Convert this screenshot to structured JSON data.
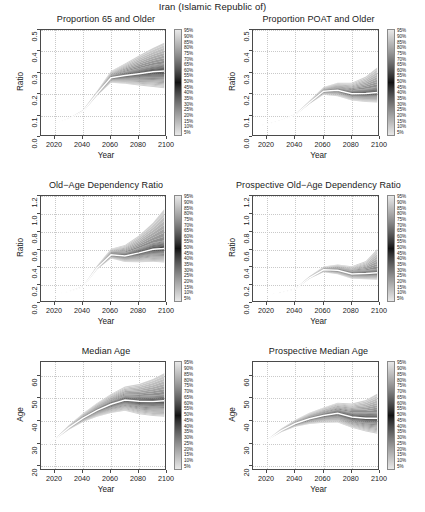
{
  "figure": {
    "main_title": "Iran (Islamic Republic of)",
    "xlabel": "Year",
    "ratio_ylabel": "Ratio",
    "age_ylabel": "Age"
  },
  "legend": {
    "labels": [
      "95%",
      "90%",
      "85%",
      "80%",
      "75%",
      "70%",
      "65%",
      "60%",
      "55%",
      "50%",
      "45%",
      "40%",
      "35%",
      "30%",
      "25%",
      "20%",
      "15%",
      "10%",
      "5%"
    ],
    "light_color": "#e8e8e8",
    "dark_color": "#141414"
  },
  "chart_data": [
    {
      "type": "area",
      "panel": "top-left",
      "title": "Proportion 65 and Older",
      "xlabel": "Year",
      "ylabel": "Ratio",
      "xlim": [
        2010,
        2100
      ],
      "ylim": [
        0.0,
        0.5
      ],
      "xticks": [
        2020,
        2040,
        2060,
        2080,
        2100
      ],
      "yticks": [
        "0.0",
        "0.1",
        "0.2",
        "0.3",
        "0.4",
        "0.5"
      ],
      "grid": true,
      "legend_position": "right",
      "x": [
        2013,
        2020,
        2030,
        2040,
        2050,
        2060,
        2070,
        2080,
        2090,
        2098
      ],
      "series": [
        {
          "name": "median",
          "values": [
            0.051,
            0.062,
            0.086,
            0.121,
            0.202,
            0.277,
            0.287,
            0.296,
            0.305,
            0.308
          ]
        },
        {
          "name": "p05",
          "values": [
            0.051,
            0.062,
            0.085,
            0.118,
            0.193,
            0.254,
            0.249,
            0.241,
            0.234,
            0.228
          ]
        },
        {
          "name": "p25",
          "values": [
            0.051,
            0.062,
            0.086,
            0.12,
            0.198,
            0.268,
            0.271,
            0.274,
            0.276,
            0.275
          ]
        },
        {
          "name": "p75",
          "values": [
            0.051,
            0.062,
            0.087,
            0.123,
            0.207,
            0.288,
            0.305,
            0.321,
            0.336,
            0.344
          ]
        },
        {
          "name": "p95",
          "values": [
            0.051,
            0.063,
            0.088,
            0.126,
            0.215,
            0.308,
            0.344,
            0.381,
            0.416,
            0.441
          ]
        }
      ]
    },
    {
      "type": "area",
      "panel": "top-right",
      "title": "Proportion POAT and Older",
      "xlabel": "Year",
      "ylabel": "Ratio",
      "xlim": [
        2010,
        2100
      ],
      "ylim": [
        0.0,
        0.5
      ],
      "xticks": [
        2020,
        2040,
        2060,
        2080,
        2100
      ],
      "yticks": [
        "0.0",
        "0.1",
        "0.2",
        "0.3",
        "0.4",
        "0.5"
      ],
      "grid": true,
      "legend_position": "right",
      "x": [
        2013,
        2020,
        2030,
        2040,
        2050,
        2060,
        2070,
        2080,
        2090,
        2098
      ],
      "series": [
        {
          "name": "median",
          "values": [
            0.051,
            0.06,
            0.077,
            0.104,
            0.16,
            0.214,
            0.218,
            0.202,
            0.203,
            0.208
          ]
        },
        {
          "name": "p05",
          "values": [
            0.051,
            0.06,
            0.077,
            0.102,
            0.154,
            0.198,
            0.191,
            0.17,
            0.164,
            0.161
          ]
        },
        {
          "name": "p25",
          "values": [
            0.051,
            0.06,
            0.077,
            0.103,
            0.157,
            0.208,
            0.208,
            0.189,
            0.186,
            0.188
          ]
        },
        {
          "name": "p75",
          "values": [
            0.051,
            0.061,
            0.078,
            0.105,
            0.163,
            0.221,
            0.23,
            0.219,
            0.226,
            0.235
          ]
        },
        {
          "name": "p95",
          "values": [
            0.051,
            0.061,
            0.079,
            0.108,
            0.169,
            0.234,
            0.254,
            0.253,
            0.283,
            0.325
          ]
        }
      ]
    },
    {
      "type": "area",
      "panel": "middle-left",
      "title": "Old−Age Dependency Ratio",
      "xlabel": "Year",
      "ylabel": "Ratio",
      "xlim": [
        2010,
        2100
      ],
      "ylim": [
        0.0,
        1.2
      ],
      "xticks": [
        2020,
        2040,
        2060,
        2080,
        2100
      ],
      "yticks": [
        "0.0",
        "0.2",
        "0.4",
        "0.6",
        "0.8",
        "1.0",
        "1.2"
      ],
      "grid": true,
      "legend_position": "right",
      "x": [
        2013,
        2020,
        2030,
        2040,
        2050,
        2060,
        2070,
        2080,
        2090,
        2098
      ],
      "series": [
        {
          "name": "median",
          "values": [
            0.085,
            0.098,
            0.128,
            0.18,
            0.392,
            0.54,
            0.528,
            0.562,
            0.602,
            0.612
          ]
        },
        {
          "name": "p05",
          "values": [
            0.085,
            0.098,
            0.127,
            0.177,
            0.376,
            0.498,
            0.461,
            0.458,
            0.462,
            0.455
          ]
        },
        {
          "name": "p25",
          "values": [
            0.085,
            0.098,
            0.128,
            0.179,
            0.386,
            0.523,
            0.501,
            0.521,
            0.545,
            0.549
          ]
        },
        {
          "name": "p75",
          "values": [
            0.085,
            0.099,
            0.129,
            0.183,
            0.4,
            0.562,
            0.566,
            0.618,
            0.677,
            0.7
          ]
        },
        {
          "name": "p95",
          "values": [
            0.085,
            0.099,
            0.131,
            0.188,
            0.419,
            0.609,
            0.65,
            0.757,
            0.901,
            1.051
          ]
        }
      ]
    },
    {
      "type": "area",
      "panel": "middle-right",
      "title": "Prospective Old−Age Dependency Ratio",
      "xlabel": "Year",
      "ylabel": "Ratio",
      "xlim": [
        2010,
        2100
      ],
      "ylim": [
        0.0,
        1.2
      ],
      "xticks": [
        2020,
        2040,
        2060,
        2080,
        2100
      ],
      "yticks": [
        "0.0",
        "0.2",
        "0.4",
        "0.6",
        "0.8",
        "1.0",
        "1.2"
      ],
      "grid": true,
      "legend_position": "right",
      "x": [
        2013,
        2020,
        2030,
        2040,
        2050,
        2060,
        2070,
        2080,
        2090,
        2098
      ],
      "series": [
        {
          "name": "median",
          "values": [
            0.078,
            0.09,
            0.116,
            0.158,
            0.283,
            0.372,
            0.368,
            0.326,
            0.33,
            0.34
          ]
        },
        {
          "name": "p05",
          "values": [
            0.078,
            0.09,
            0.115,
            0.155,
            0.272,
            0.345,
            0.322,
            0.273,
            0.265,
            0.262
          ]
        },
        {
          "name": "p25",
          "values": [
            0.078,
            0.09,
            0.116,
            0.157,
            0.278,
            0.361,
            0.35,
            0.305,
            0.303,
            0.308
          ]
        },
        {
          "name": "p75",
          "values": [
            0.078,
            0.091,
            0.117,
            0.16,
            0.289,
            0.385,
            0.39,
            0.355,
            0.367,
            0.383
          ]
        },
        {
          "name": "p95",
          "values": [
            0.078,
            0.091,
            0.118,
            0.164,
            0.3,
            0.408,
            0.432,
            0.412,
            0.47,
            0.605
          ]
        }
      ]
    },
    {
      "type": "area",
      "panel": "bottom-left",
      "title": "Median Age",
      "xlabel": "Year",
      "ylabel": "Age",
      "xlim": [
        2010,
        2100
      ],
      "ylim": [
        18,
        66
      ],
      "xticks": [
        2020,
        2040,
        2060,
        2080,
        2100
      ],
      "yticks": [
        "20",
        "30",
        "40",
        "50",
        "60"
      ],
      "grid": true,
      "legend_position": "right",
      "x": [
        2013,
        2020,
        2030,
        2040,
        2050,
        2060,
        2070,
        2080,
        2090,
        2098
      ],
      "series": [
        {
          "name": "median",
          "values": [
            28.2,
            32.0,
            37.1,
            41.3,
            44.7,
            47.4,
            49.3,
            48.7,
            48.6,
            48.9
          ]
        },
        {
          "name": "p05",
          "values": [
            28.2,
            31.9,
            36.2,
            39.6,
            41.9,
            43.5,
            44.5,
            43.0,
            42.2,
            41.9
          ]
        },
        {
          "name": "p25",
          "values": [
            28.2,
            32.0,
            36.8,
            40.6,
            43.6,
            45.9,
            47.4,
            46.4,
            46.0,
            46.2
          ]
        },
        {
          "name": "p75",
          "values": [
            28.2,
            32.1,
            37.5,
            42.0,
            45.8,
            48.9,
            51.2,
            51.0,
            51.3,
            51.7
          ]
        },
        {
          "name": "p95",
          "values": [
            28.2,
            32.2,
            38.3,
            43.4,
            48.0,
            51.9,
            55.2,
            56.3,
            58.5,
            61.0
          ]
        }
      ]
    },
    {
      "type": "area",
      "panel": "bottom-right",
      "title": "Prospective Median Age",
      "xlabel": "Year",
      "ylabel": "Age",
      "xlim": [
        2010,
        2100
      ],
      "ylim": [
        18,
        66
      ],
      "xticks": [
        2020,
        2040,
        2060,
        2080,
        2100
      ],
      "yticks": [
        "20",
        "30",
        "40",
        "50",
        "60"
      ],
      "grid": true,
      "legend_position": "right",
      "x": [
        2013,
        2020,
        2030,
        2040,
        2050,
        2060,
        2070,
        2080,
        2090,
        2098
      ],
      "series": [
        {
          "name": "median",
          "values": [
            28.2,
            31.6,
            35.8,
            38.9,
            41.0,
            42.4,
            43.4,
            41.8,
            41.2,
            41.2
          ]
        },
        {
          "name": "p05",
          "values": [
            28.2,
            31.5,
            35.1,
            37.5,
            38.7,
            39.3,
            39.4,
            37.0,
            35.4,
            34.4
          ]
        },
        {
          "name": "p25",
          "values": [
            28.2,
            31.6,
            35.5,
            38.3,
            40.1,
            41.2,
            41.8,
            39.8,
            38.9,
            38.6
          ]
        },
        {
          "name": "p75",
          "values": [
            28.2,
            31.7,
            36.1,
            39.5,
            42.0,
            43.7,
            45.1,
            43.9,
            43.7,
            44.0
          ]
        },
        {
          "name": "p95",
          "values": [
            28.2,
            31.8,
            36.7,
            40.6,
            43.6,
            46.0,
            48.1,
            47.7,
            49.3,
            52.0
          ]
        }
      ]
    }
  ]
}
